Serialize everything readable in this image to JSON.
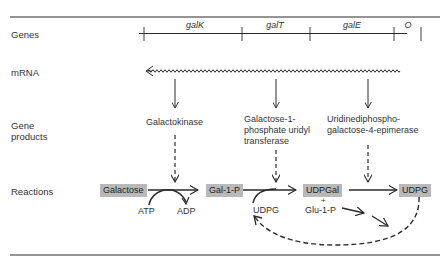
{
  "rows": {
    "genes": "Genes",
    "mrna": "mRNA",
    "gene_products_line1": "Gene",
    "gene_products_line2": "products",
    "reactions": "Reactions"
  },
  "genes": [
    {
      "name": "galK"
    },
    {
      "name": "galT"
    },
    {
      "name": "galE"
    },
    {
      "name": "O"
    }
  ],
  "gene_products": [
    {
      "lines": [
        "Galactokinase"
      ]
    },
    {
      "lines": [
        "Galactose-1-",
        "phosphate uridyl",
        "transferase"
      ]
    },
    {
      "lines": [
        "Uridinediphospho-",
        "galactose-4-epimerase"
      ]
    }
  ],
  "reactions": {
    "substrates": {
      "galactose": "Galactose",
      "gal1p": "Gal-1-P",
      "udpgal": "UDPGal",
      "udpg_product": "UDPG"
    },
    "cofactors": {
      "atp": "ATP",
      "adp": "ADP",
      "udpg": "UDPG",
      "plus": "+",
      "glu1p": "Glu-1-P"
    }
  },
  "colors": {
    "box_fill": "#b9b9b9",
    "line": "#2a2a2a"
  }
}
